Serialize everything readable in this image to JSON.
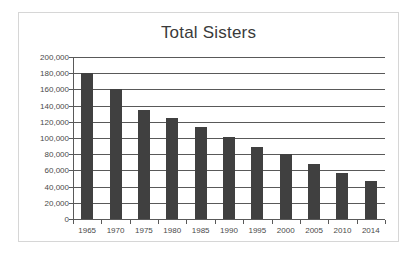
{
  "chart_data": {
    "type": "bar",
    "title": "Total Sisters",
    "xlabel": "",
    "ylabel": "",
    "categories": [
      "1965",
      "1970",
      "1975",
      "1980",
      "1985",
      "1990",
      "1995",
      "2000",
      "2005",
      "2010",
      "2014"
    ],
    "values": [
      180000,
      161000,
      134000,
      125000,
      113000,
      101000,
      88500,
      80000,
      67500,
      57000,
      47000
    ],
    "ylim": [
      0,
      200000
    ],
    "ytick_labels": [
      "200,000",
      "180,000",
      "160,000",
      "140,000",
      "120,000",
      "100,000",
      "80,000",
      "60,000",
      "40,000",
      "20,000",
      "0"
    ],
    "ytick_values": [
      200000,
      180000,
      160000,
      140000,
      120000,
      100000,
      80000,
      60000,
      40000,
      20000,
      0
    ],
    "grid": true,
    "legend": null,
    "legend_position": "none",
    "colors": {
      "bar": "#404040",
      "grid": "#595959",
      "axis": "#595959",
      "text": "#4a4a4a",
      "title": "#3a3a3a",
      "border": "#d6d6d6",
      "background": "#ffffff"
    }
  }
}
